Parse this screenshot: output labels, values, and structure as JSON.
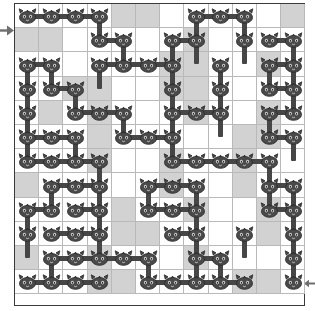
{
  "puzzle": {
    "title": "Cat Chain Grid Puzzle",
    "grid_label": "12 x 12 grid",
    "cols": 12,
    "rows": 12,
    "cell_size": 24.2,
    "colors": {
      "background": "#ffffff",
      "grid_line": "#b9b9b9",
      "border": "#3a3a3a",
      "shaded_cell": "#d2d2d2",
      "token": "#464646",
      "token_outline": "#2b2b2b",
      "connector": "#464646",
      "arrow": "#6e6e6e"
    },
    "entry_marker": {
      "name": "entry-arrow",
      "direction": "right",
      "row": 0,
      "side": "left"
    },
    "exit_marker": {
      "name": "exit-arrow",
      "direction": "left",
      "row": 11,
      "side": "right"
    },
    "shaded_cells": [
      [
        0,
        4
      ],
      [
        0,
        5
      ],
      [
        0,
        11
      ],
      [
        1,
        0
      ],
      [
        1,
        1
      ],
      [
        1,
        7
      ],
      [
        2,
        6
      ],
      [
        2,
        7
      ],
      [
        2,
        10
      ],
      [
        3,
        2
      ],
      [
        3,
        3
      ],
      [
        3,
        6
      ],
      [
        3,
        7
      ],
      [
        4,
        1
      ],
      [
        4,
        3
      ],
      [
        4,
        7
      ],
      [
        4,
        10
      ],
      [
        5,
        3
      ],
      [
        5,
        9
      ],
      [
        5,
        10
      ],
      [
        6,
        3
      ],
      [
        6,
        6
      ],
      [
        6,
        9
      ],
      [
        7,
        0
      ],
      [
        7,
        6
      ],
      [
        7,
        9
      ],
      [
        8,
        4
      ],
      [
        8,
        7
      ],
      [
        8,
        10
      ],
      [
        9,
        4
      ],
      [
        9,
        5
      ],
      [
        9,
        10
      ],
      [
        10,
        0
      ],
      [
        10,
        3
      ],
      [
        10,
        7
      ],
      [
        11,
        3
      ],
      [
        11,
        4
      ],
      [
        11,
        9
      ],
      [
        11,
        10
      ]
    ],
    "tokens": [
      {
        "r": 0,
        "c": 0
      },
      {
        "r": 0,
        "c": 1
      },
      {
        "r": 0,
        "c": 2
      },
      {
        "r": 0,
        "c": 3
      },
      {
        "r": 0,
        "c": 7
      },
      {
        "r": 0,
        "c": 8
      },
      {
        "r": 0,
        "c": 9
      },
      {
        "r": 1,
        "c": 3
      },
      {
        "r": 1,
        "c": 4
      },
      {
        "r": 1,
        "c": 6
      },
      {
        "r": 1,
        "c": 7
      },
      {
        "r": 1,
        "c": 9
      },
      {
        "r": 1,
        "c": 10
      },
      {
        "r": 1,
        "c": 11
      },
      {
        "r": 2,
        "c": 0
      },
      {
        "r": 2,
        "c": 1
      },
      {
        "r": 2,
        "c": 3
      },
      {
        "r": 2,
        "c": 4
      },
      {
        "r": 2,
        "c": 5
      },
      {
        "r": 2,
        "c": 6
      },
      {
        "r": 2,
        "c": 8
      },
      {
        "r": 2,
        "c": 10
      },
      {
        "r": 2,
        "c": 11
      },
      {
        "r": 3,
        "c": 0
      },
      {
        "r": 3,
        "c": 1
      },
      {
        "r": 3,
        "c": 2
      },
      {
        "r": 3,
        "c": 6
      },
      {
        "r": 3,
        "c": 8
      },
      {
        "r": 3,
        "c": 10
      },
      {
        "r": 3,
        "c": 11
      },
      {
        "r": 4,
        "c": 0
      },
      {
        "r": 4,
        "c": 2
      },
      {
        "r": 4,
        "c": 3
      },
      {
        "r": 4,
        "c": 4
      },
      {
        "r": 4,
        "c": 6
      },
      {
        "r": 4,
        "c": 7
      },
      {
        "r": 4,
        "c": 8
      },
      {
        "r": 4,
        "c": 10
      },
      {
        "r": 4,
        "c": 11
      },
      {
        "r": 5,
        "c": 0
      },
      {
        "r": 5,
        "c": 1
      },
      {
        "r": 5,
        "c": 2
      },
      {
        "r": 5,
        "c": 4
      },
      {
        "r": 5,
        "c": 5
      },
      {
        "r": 5,
        "c": 6
      },
      {
        "r": 5,
        "c": 10
      },
      {
        "r": 5,
        "c": 11
      },
      {
        "r": 6,
        "c": 0
      },
      {
        "r": 6,
        "c": 1
      },
      {
        "r": 6,
        "c": 2
      },
      {
        "r": 6,
        "c": 3
      },
      {
        "r": 6,
        "c": 6
      },
      {
        "r": 6,
        "c": 7
      },
      {
        "r": 6,
        "c": 8
      },
      {
        "r": 6,
        "c": 9
      },
      {
        "r": 6,
        "c": 10
      },
      {
        "r": 7,
        "c": 1
      },
      {
        "r": 7,
        "c": 2
      },
      {
        "r": 7,
        "c": 3
      },
      {
        "r": 7,
        "c": 5
      },
      {
        "r": 7,
        "c": 6
      },
      {
        "r": 7,
        "c": 7
      },
      {
        "r": 7,
        "c": 10
      },
      {
        "r": 7,
        "c": 11
      },
      {
        "r": 8,
        "c": 0
      },
      {
        "r": 8,
        "c": 1
      },
      {
        "r": 8,
        "c": 2
      },
      {
        "r": 8,
        "c": 3
      },
      {
        "r": 8,
        "c": 5
      },
      {
        "r": 8,
        "c": 6
      },
      {
        "r": 8,
        "c": 7
      },
      {
        "r": 8,
        "c": 10
      },
      {
        "r": 8,
        "c": 11
      },
      {
        "r": 9,
        "c": 0
      },
      {
        "r": 9,
        "c": 1
      },
      {
        "r": 9,
        "c": 2
      },
      {
        "r": 9,
        "c": 3
      },
      {
        "r": 9,
        "c": 6
      },
      {
        "r": 9,
        "c": 7
      },
      {
        "r": 9,
        "c": 9
      },
      {
        "r": 9,
        "c": 11
      },
      {
        "r": 10,
        "c": 1
      },
      {
        "r": 10,
        "c": 2
      },
      {
        "r": 10,
        "c": 3
      },
      {
        "r": 10,
        "c": 4
      },
      {
        "r": 10,
        "c": 5
      },
      {
        "r": 10,
        "c": 7
      },
      {
        "r": 10,
        "c": 8
      },
      {
        "r": 10,
        "c": 11
      },
      {
        "r": 11,
        "c": 0
      },
      {
        "r": 11,
        "c": 1
      },
      {
        "r": 11,
        "c": 2
      },
      {
        "r": 11,
        "c": 3
      },
      {
        "r": 11,
        "c": 5
      },
      {
        "r": 11,
        "c": 6
      },
      {
        "r": 11,
        "c": 7
      },
      {
        "r": 11,
        "c": 8
      },
      {
        "r": 11,
        "c": 9
      },
      {
        "r": 11,
        "c": 11
      }
    ],
    "connections": [
      {
        "r": 0,
        "c": 0,
        "dir": "h"
      },
      {
        "r": 0,
        "c": 1,
        "dir": "h"
      },
      {
        "r": 0,
        "c": 2,
        "dir": "h"
      },
      {
        "r": 0,
        "c": 3,
        "dir": "v"
      },
      {
        "r": 0,
        "c": 7,
        "dir": "h"
      },
      {
        "r": 0,
        "c": 8,
        "dir": "h"
      },
      {
        "r": 0,
        "c": 7,
        "dir": "v"
      },
      {
        "r": 0,
        "c": 9,
        "dir": "v"
      },
      {
        "r": 1,
        "c": 3,
        "dir": "h"
      },
      {
        "r": 1,
        "c": 4,
        "dir": "v"
      },
      {
        "r": 1,
        "c": 6,
        "dir": "h"
      },
      {
        "r": 1,
        "c": 6,
        "dir": "v"
      },
      {
        "r": 1,
        "c": 7,
        "dir": "v"
      },
      {
        "r": 1,
        "c": 9,
        "dir": "v"
      },
      {
        "r": 1,
        "c": 10,
        "dir": "h"
      },
      {
        "r": 1,
        "c": 11,
        "dir": "v"
      },
      {
        "r": 2,
        "c": 0,
        "dir": "h"
      },
      {
        "r": 2,
        "c": 0,
        "dir": "v"
      },
      {
        "r": 2,
        "c": 1,
        "dir": "v"
      },
      {
        "r": 2,
        "c": 3,
        "dir": "h"
      },
      {
        "r": 2,
        "c": 4,
        "dir": "h"
      },
      {
        "r": 2,
        "c": 5,
        "dir": "h"
      },
      {
        "r": 2,
        "c": 3,
        "dir": "v"
      },
      {
        "r": 2,
        "c": 6,
        "dir": "v"
      },
      {
        "r": 2,
        "c": 8,
        "dir": "v"
      },
      {
        "r": 2,
        "c": 10,
        "dir": "h"
      },
      {
        "r": 2,
        "c": 10,
        "dir": "v"
      },
      {
        "r": 2,
        "c": 11,
        "dir": "v"
      },
      {
        "r": 3,
        "c": 0,
        "dir": "v"
      },
      {
        "r": 3,
        "c": 1,
        "dir": "h"
      },
      {
        "r": 3,
        "c": 2,
        "dir": "v"
      },
      {
        "r": 3,
        "c": 6,
        "dir": "v"
      },
      {
        "r": 3,
        "c": 8,
        "dir": "v"
      },
      {
        "r": 3,
        "c": 10,
        "dir": "h"
      },
      {
        "r": 3,
        "c": 11,
        "dir": "v"
      },
      {
        "r": 4,
        "c": 0,
        "dir": "v"
      },
      {
        "r": 4,
        "c": 2,
        "dir": "h"
      },
      {
        "r": 4,
        "c": 3,
        "dir": "h"
      },
      {
        "r": 4,
        "c": 4,
        "dir": "v"
      },
      {
        "r": 4,
        "c": 6,
        "dir": "h"
      },
      {
        "r": 4,
        "c": 7,
        "dir": "h"
      },
      {
        "r": 4,
        "c": 6,
        "dir": "v"
      },
      {
        "r": 4,
        "c": 8,
        "dir": "v"
      },
      {
        "r": 4,
        "c": 10,
        "dir": "h"
      },
      {
        "r": 4,
        "c": 10,
        "dir": "v"
      },
      {
        "r": 5,
        "c": 0,
        "dir": "h"
      },
      {
        "r": 5,
        "c": 0,
        "dir": "v"
      },
      {
        "r": 5,
        "c": 1,
        "dir": "h"
      },
      {
        "r": 5,
        "c": 2,
        "dir": "v"
      },
      {
        "r": 5,
        "c": 4,
        "dir": "h"
      },
      {
        "r": 5,
        "c": 5,
        "dir": "h"
      },
      {
        "r": 5,
        "c": 6,
        "dir": "v"
      },
      {
        "r": 5,
        "c": 10,
        "dir": "h"
      },
      {
        "r": 5,
        "c": 11,
        "dir": "v"
      },
      {
        "r": 6,
        "c": 0,
        "dir": "h"
      },
      {
        "r": 6,
        "c": 1,
        "dir": "h"
      },
      {
        "r": 6,
        "c": 2,
        "dir": "h"
      },
      {
        "r": 6,
        "c": 3,
        "dir": "v"
      },
      {
        "r": 6,
        "c": 6,
        "dir": "h"
      },
      {
        "r": 6,
        "c": 7,
        "dir": "h"
      },
      {
        "r": 6,
        "c": 8,
        "dir": "h"
      },
      {
        "r": 6,
        "c": 9,
        "dir": "h"
      },
      {
        "r": 6,
        "c": 10,
        "dir": "v"
      },
      {
        "r": 7,
        "c": 1,
        "dir": "h"
      },
      {
        "r": 7,
        "c": 2,
        "dir": "h"
      },
      {
        "r": 7,
        "c": 1,
        "dir": "v"
      },
      {
        "r": 7,
        "c": 3,
        "dir": "v"
      },
      {
        "r": 7,
        "c": 5,
        "dir": "h"
      },
      {
        "r": 7,
        "c": 6,
        "dir": "h"
      },
      {
        "r": 7,
        "c": 5,
        "dir": "v"
      },
      {
        "r": 7,
        "c": 7,
        "dir": "v"
      },
      {
        "r": 7,
        "c": 10,
        "dir": "h"
      },
      {
        "r": 7,
        "c": 10,
        "dir": "v"
      },
      {
        "r": 7,
        "c": 11,
        "dir": "v"
      },
      {
        "r": 8,
        "c": 0,
        "dir": "h"
      },
      {
        "r": 8,
        "c": 0,
        "dir": "v"
      },
      {
        "r": 8,
        "c": 2,
        "dir": "h"
      },
      {
        "r": 8,
        "c": 3,
        "dir": "v"
      },
      {
        "r": 8,
        "c": 5,
        "dir": "h"
      },
      {
        "r": 8,
        "c": 6,
        "dir": "h"
      },
      {
        "r": 8,
        "c": 7,
        "dir": "v"
      },
      {
        "r": 8,
        "c": 10,
        "dir": "h"
      },
      {
        "r": 8,
        "c": 11,
        "dir": "v"
      },
      {
        "r": 9,
        "c": 0,
        "dir": "v"
      },
      {
        "r": 9,
        "c": 1,
        "dir": "h"
      },
      {
        "r": 9,
        "c": 2,
        "dir": "h"
      },
      {
        "r": 9,
        "c": 3,
        "dir": "v"
      },
      {
        "r": 9,
        "c": 6,
        "dir": "h"
      },
      {
        "r": 9,
        "c": 7,
        "dir": "v"
      },
      {
        "r": 9,
        "c": 9,
        "dir": "v"
      },
      {
        "r": 9,
        "c": 11,
        "dir": "v"
      },
      {
        "r": 10,
        "c": 1,
        "dir": "h"
      },
      {
        "r": 10,
        "c": 2,
        "dir": "h"
      },
      {
        "r": 10,
        "c": 3,
        "dir": "h"
      },
      {
        "r": 10,
        "c": 4,
        "dir": "h"
      },
      {
        "r": 10,
        "c": 1,
        "dir": "v"
      },
      {
        "r": 10,
        "c": 5,
        "dir": "v"
      },
      {
        "r": 10,
        "c": 7,
        "dir": "h"
      },
      {
        "r": 10,
        "c": 7,
        "dir": "v"
      },
      {
        "r": 10,
        "c": 8,
        "dir": "v"
      },
      {
        "r": 10,
        "c": 11,
        "dir": "v"
      },
      {
        "r": 11,
        "c": 0,
        "dir": "h"
      },
      {
        "r": 11,
        "c": 1,
        "dir": "h"
      },
      {
        "r": 11,
        "c": 2,
        "dir": "h"
      },
      {
        "r": 11,
        "c": 5,
        "dir": "h"
      },
      {
        "r": 11,
        "c": 6,
        "dir": "h"
      },
      {
        "r": 11,
        "c": 7,
        "dir": "h"
      },
      {
        "r": 11,
        "c": 8,
        "dir": "h"
      }
    ]
  }
}
